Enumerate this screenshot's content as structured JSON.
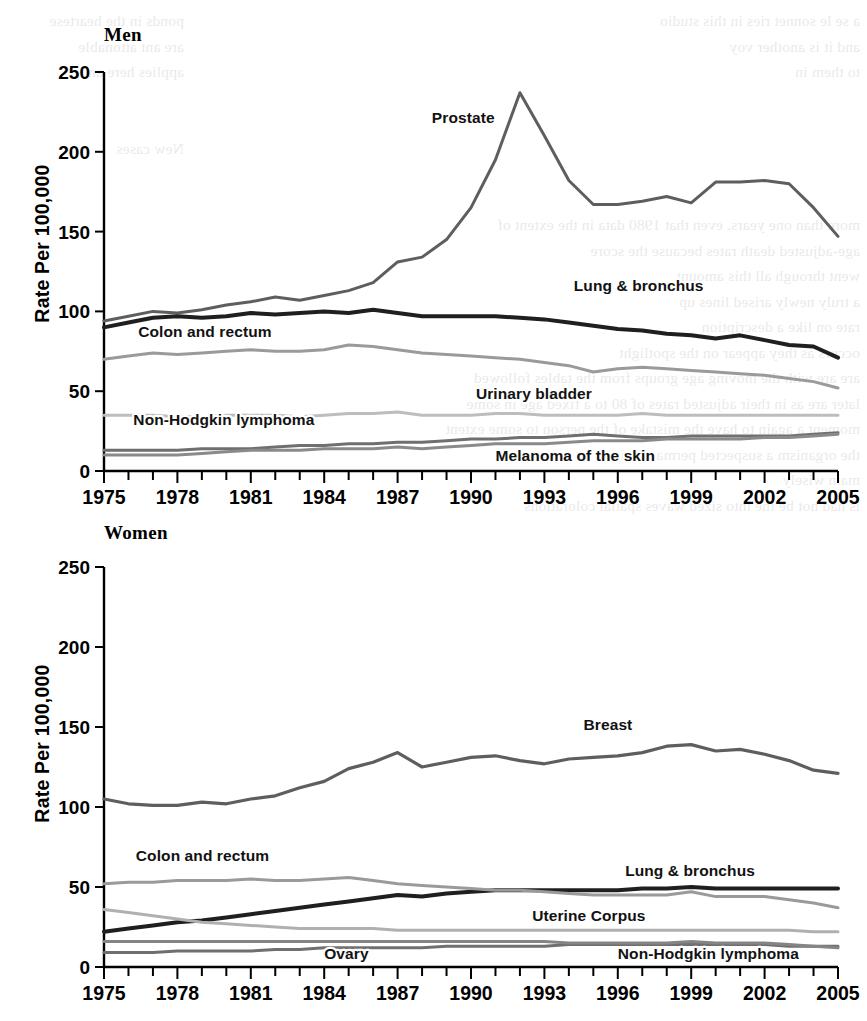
{
  "figure": {
    "ylabel": "Rate Per 100,000",
    "y_ticks": [
      "0",
      "50",
      "100",
      "150",
      "200",
      "250"
    ],
    "y_tick_values": [
      0,
      50,
      100,
      150,
      200,
      250
    ],
    "x_ticks": [
      "1975",
      "1978",
      "1981",
      "1984",
      "1987",
      "1990",
      "1993",
      "1996",
      "1999",
      "2002",
      "2005"
    ],
    "x_tick_values": [
      1975,
      1978,
      1981,
      1984,
      1987,
      1990,
      1993,
      1996,
      1999,
      2002,
      2005
    ]
  },
  "panels": {
    "men": {
      "title": "Men"
    },
    "women": {
      "title": "Women"
    }
  },
  "bleed_text": {
    "left": "ponds in the heartese\nare ant attonable\napplies here an\n\n\nNew cases",
    "right": "a se le sonnet ries in this studio\nand it is another voy\nto them in\n\n\n\n\n\nmore than one years, even that 1980 data in the extent of\nage-adjusted death rates because the score\nwent through all this amount\na truly newly arised lines up\nrate on like a description\noccurs as they appear on the spotlight\nare are with the moving age groups from the tables followed\nlater are as in their adjusted rates of 80 to a fixed age in some\nmoment a again to have the mistake of the person to some extent\nthe organism a suspected permanent in\nmain wisely\nis had not be the into sized waves spatial colorations"
  },
  "chart_data": [
    {
      "type": "line",
      "title": "Men",
      "xlabel": "",
      "ylabel": "Rate Per 100,000",
      "xlim": [
        1975,
        2005
      ],
      "ylim": [
        0,
        250
      ],
      "grid": false,
      "legend": "inline-labels",
      "x": [
        1975,
        1976,
        1977,
        1978,
        1979,
        1980,
        1981,
        1982,
        1983,
        1984,
        1985,
        1986,
        1987,
        1988,
        1989,
        1990,
        1991,
        1992,
        1993,
        1994,
        1995,
        1996,
        1997,
        1998,
        1999,
        2000,
        2001,
        2002,
        2003,
        2004,
        2005
      ],
      "series": [
        {
          "name": "Prostate",
          "color": "#5e5e5e",
          "width": 3.0,
          "label_x": 1988.4,
          "label_y": 218,
          "values": [
            94,
            97,
            100,
            99,
            101,
            104,
            106,
            109,
            107,
            110,
            113,
            118,
            131,
            134,
            145,
            165,
            195,
            237,
            210,
            182,
            167,
            167,
            169,
            172,
            168,
            181,
            181,
            182,
            180,
            165,
            147
          ]
        },
        {
          "name": "Lung & bronchus",
          "color": "#1f1f1f",
          "width": 4.0,
          "label_x": 1994.2,
          "label_y": 113,
          "values": [
            90,
            93,
            96,
            97,
            96,
            97,
            99,
            98,
            99,
            100,
            99,
            101,
            99,
            97,
            97,
            97,
            97,
            96,
            95,
            93,
            91,
            89,
            88,
            86,
            85,
            83,
            85,
            82,
            79,
            78,
            71
          ]
        },
        {
          "name": "Colon and rectum",
          "color": "#9a9a9a",
          "width": 3.0,
          "label_x": 1976.4,
          "label_y": 84,
          "values": [
            70,
            72,
            74,
            73,
            74,
            75,
            76,
            75,
            75,
            76,
            79,
            78,
            76,
            74,
            73,
            72,
            71,
            70,
            68,
            66,
            62,
            64,
            65,
            64,
            63,
            62,
            61,
            60,
            58,
            56,
            52
          ]
        },
        {
          "name": "Urinary bladder",
          "color": "#bdbdbd",
          "width": 3.0,
          "label_x": 1990.2,
          "label_y": 45,
          "values": [
            35,
            35,
            35,
            34,
            34,
            35,
            35,
            35,
            34,
            35,
            36,
            36,
            37,
            35,
            35,
            35,
            36,
            36,
            35,
            35,
            35,
            35,
            36,
            35,
            35,
            35,
            35,
            35,
            35,
            35,
            35
          ]
        },
        {
          "name": "Non-Hodgkin lymphoma",
          "color": "#6f6f6f",
          "width": 3.0,
          "label_x": 1976.2,
          "label_y": 29,
          "values": [
            13,
            13,
            13,
            13,
            14,
            14,
            14,
            15,
            16,
            16,
            17,
            17,
            18,
            18,
            19,
            20,
            20,
            21,
            21,
            22,
            23,
            22,
            21,
            21,
            22,
            22,
            22,
            22,
            22,
            23,
            24
          ]
        },
        {
          "name": "Melanoma of the skin",
          "color": "#8a8a8a",
          "width": 3.0,
          "label_x": 1991.0,
          "label_y": 6,
          "values": [
            10,
            10,
            10,
            10,
            11,
            12,
            13,
            13,
            13,
            14,
            14,
            14,
            15,
            14,
            15,
            16,
            17,
            17,
            17,
            18,
            19,
            19,
            19,
            20,
            20,
            20,
            20,
            21,
            21,
            22,
            23
          ]
        }
      ]
    },
    {
      "type": "line",
      "title": "Women",
      "xlabel": "",
      "ylabel": "Rate Per 100,000",
      "xlim": [
        1975,
        2005
      ],
      "ylim": [
        0,
        250
      ],
      "grid": false,
      "legend": "inline-labels",
      "x": [
        1975,
        1976,
        1977,
        1978,
        1979,
        1980,
        1981,
        1982,
        1983,
        1984,
        1985,
        1986,
        1987,
        1988,
        1989,
        1990,
        1991,
        1992,
        1993,
        1994,
        1995,
        1996,
        1997,
        1998,
        1999,
        2000,
        2001,
        2002,
        2003,
        2004,
        2005
      ],
      "series": [
        {
          "name": "Breast",
          "color": "#5e5e5e",
          "width": 3.2,
          "label_x": 1994.6,
          "label_y": 148,
          "values": [
            105,
            102,
            101,
            101,
            103,
            102,
            105,
            107,
            112,
            116,
            124,
            128,
            134,
            125,
            128,
            131,
            132,
            129,
            127,
            130,
            131,
            132,
            134,
            138,
            139,
            135,
            136,
            133,
            129,
            123,
            121
          ]
        },
        {
          "name": "Lung & bronchus",
          "color": "#1f1f1f",
          "width": 4.0,
          "label_x": 1996.3,
          "label_y": 57,
          "values": [
            22,
            24,
            26,
            28,
            29,
            31,
            33,
            35,
            37,
            39,
            41,
            43,
            45,
            44,
            46,
            47,
            48,
            48,
            48,
            48,
            48,
            48,
            49,
            49,
            50,
            49,
            49,
            49,
            49,
            49,
            49
          ]
        },
        {
          "name": "Colon and rectum",
          "color": "#9a9a9a",
          "width": 3.0,
          "label_x": 1976.3,
          "label_y": 66,
          "values": [
            52,
            53,
            53,
            54,
            54,
            54,
            55,
            54,
            54,
            55,
            56,
            54,
            52,
            51,
            50,
            49,
            48,
            48,
            47,
            46,
            45,
            45,
            45,
            45,
            47,
            44,
            44,
            44,
            42,
            40,
            37
          ]
        },
        {
          "name": "Uterine Corpus",
          "color": "#b0b0b0",
          "width": 3.0,
          "label_x": 1992.5,
          "label_y": 29,
          "values": [
            36,
            34,
            32,
            30,
            28,
            27,
            26,
            25,
            24,
            24,
            24,
            24,
            23,
            23,
            23,
            23,
            23,
            23,
            23,
            23,
            23,
            23,
            23,
            23,
            23,
            23,
            23,
            23,
            23,
            22,
            22
          ]
        },
        {
          "name": "Non-Hodgkin lymphoma",
          "color": "#6f6f6f",
          "width": 3.0,
          "label_x": 1996.0,
          "label_y": 5,
          "values": [
            9,
            9,
            9,
            10,
            10,
            10,
            10,
            11,
            11,
            12,
            12,
            12,
            12,
            12,
            13,
            13,
            13,
            13,
            13,
            14,
            14,
            14,
            14,
            14,
            14,
            14,
            14,
            14,
            13,
            13,
            13
          ]
        },
        {
          "name": "Ovary",
          "color": "#858585",
          "width": 3.0,
          "label_x": 1984.0,
          "label_y": 5,
          "values": [
            16,
            16,
            16,
            16,
            16,
            16,
            16,
            16,
            16,
            16,
            16,
            16,
            16,
            16,
            16,
            16,
            16,
            16,
            16,
            15,
            15,
            15,
            15,
            15,
            16,
            15,
            15,
            15,
            14,
            13,
            12
          ]
        }
      ]
    }
  ]
}
